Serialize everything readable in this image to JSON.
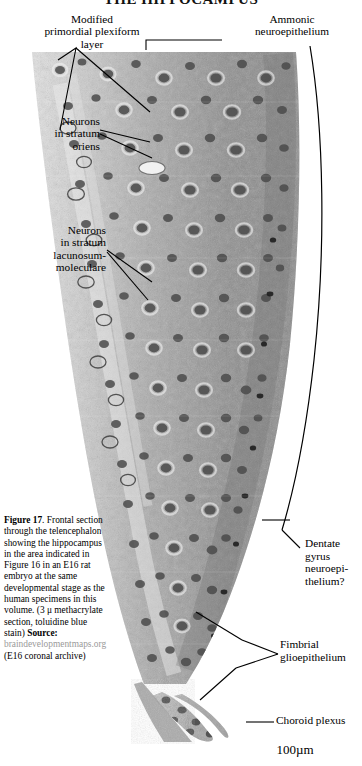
{
  "page": {
    "running_title": "THE HIPPOCAMPUS",
    "background": "#ffffff",
    "ink": "#000000"
  },
  "figure": {
    "kind": "histology-micrograph",
    "scale_bar_label": "100µm"
  },
  "annotations": {
    "modified_primordial_plexiform_layer": "Modified\nprimordial plexiform\nlayer",
    "ammonic_neuroepithelium": "Ammonic\nneuroepithelium",
    "neurons_stratum_oriens": "Neurons\nin stratum\noriens",
    "neurons_stratum_lacunosum_moleculare": "Neurons\nin stratum\nlacunosum-\nmoleculare",
    "dentate_gyrus_neuroepithelium": "Dentate\ngyrus\nneuroepi-\nthelium?",
    "fimbrial_glioepithelium": "Fimbrial\nglioepithelium",
    "choroid_plexus": "Choroid plexus"
  },
  "caption": {
    "figure_number": "Figure 17",
    "body": ". Frontal section through the telencephalon showing the hippocampus in the area indicated in Figure 16 in an E16 rat embryo at the same developmental stage as the human specimens in this volume. (3 μ methacrylate section, toluidine blue stain) ",
    "source_label": "Source:",
    "source_url": "braindevelopmentmaps.org",
    "source_suffix": " (E16 coronal archive)"
  },
  "colors": {
    "tissue_dark": "#4c4c4c",
    "tissue_mid": "#8e8e8e",
    "tissue_light": "#d8d8d8",
    "leader": "#000000",
    "source_url": "#9a9a9a"
  }
}
